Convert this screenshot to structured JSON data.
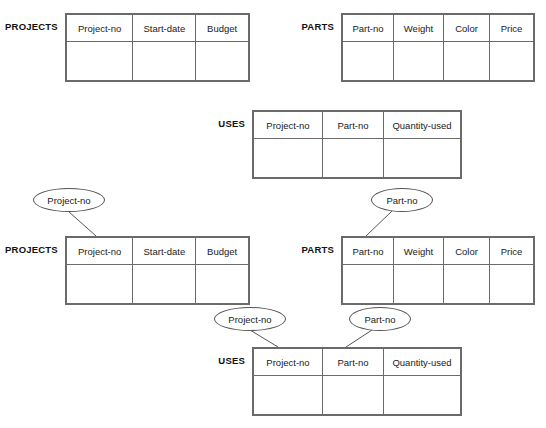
{
  "diagram": {
    "relations": [
      {
        "id": "projects-top",
        "name": "PROJECTS",
        "columns": [
          "Project-no",
          "Start-date",
          "Budget"
        ],
        "column_widths": [
          68,
          64,
          54
        ]
      },
      {
        "id": "parts-top",
        "name": "PARTS",
        "columns": [
          "Part-no",
          "Weight",
          "Color",
          "Price"
        ],
        "column_widths": [
          50,
          49,
          45,
          43
        ]
      },
      {
        "id": "uses-top",
        "name": "USES",
        "columns": [
          "Project-no",
          "Part-no",
          "Quantity-used"
        ],
        "column_widths": [
          68,
          60,
          76
        ]
      },
      {
        "id": "projects-bottom",
        "name": "PROJECTS",
        "columns": [
          "Project-no",
          "Start-date",
          "Budget"
        ],
        "column_widths": [
          68,
          64,
          54
        ]
      },
      {
        "id": "parts-bottom",
        "name": "PARTS",
        "columns": [
          "Part-no",
          "Weight",
          "Color",
          "Price"
        ],
        "column_widths": [
          50,
          49,
          45,
          43
        ]
      },
      {
        "id": "uses-bottom",
        "name": "USES",
        "columns": [
          "Project-no",
          "Part-no",
          "Quantity-used"
        ],
        "column_widths": [
          68,
          60,
          76
        ]
      }
    ],
    "attribute_nodes": [
      {
        "id": "attr-projects-projectno",
        "label": "Project-no"
      },
      {
        "id": "attr-parts-partno",
        "label": "Part-no"
      },
      {
        "id": "attr-uses-projectno",
        "label": "Project-no"
      },
      {
        "id": "attr-uses-partno",
        "label": "Part-no"
      }
    ],
    "colors": {
      "line": "#555555",
      "table_border": "#6a6a6a",
      "text": "#1a1a1a",
      "background": "#ffffff"
    }
  }
}
